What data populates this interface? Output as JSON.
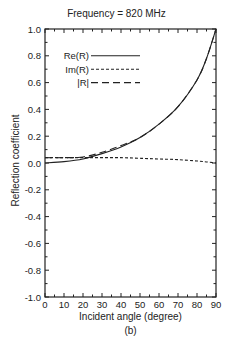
{
  "chart_data": {
    "type": "line",
    "title": "Frequency = 820 MHz",
    "xlabel": "Incident angle (degree)",
    "ylabel": "Reflection coefficient",
    "caption": "(b)",
    "xlim": [
      0,
      90
    ],
    "ylim": [
      -1.0,
      1.0
    ],
    "xticks": [
      0,
      10,
      20,
      30,
      40,
      50,
      60,
      70,
      80,
      90
    ],
    "yticks": [
      -1.0,
      -0.8,
      -0.6,
      -0.4,
      -0.2,
      0.0,
      0.2,
      0.4,
      0.6,
      0.8,
      1.0
    ],
    "ytick_labels": [
      "-1.0",
      "-0.8",
      "-0.6",
      "-0.4",
      "-0.2",
      "0.0",
      "0.2",
      "0.4",
      "0.6",
      "0.8",
      "1.0"
    ],
    "grid": false,
    "legend_position": "upper-left",
    "x": [
      0,
      10,
      20,
      30,
      40,
      50,
      60,
      70,
      80,
      85,
      90
    ],
    "series": [
      {
        "name": "Re(R)",
        "style": "solid",
        "values": [
          0.0,
          0.01,
          0.03,
          0.07,
          0.12,
          0.19,
          0.29,
          0.42,
          0.62,
          0.78,
          1.0
        ]
      },
      {
        "name": "Im(R)",
        "style": "short-dash",
        "values": [
          0.04,
          0.04,
          0.04,
          0.04,
          0.04,
          0.035,
          0.03,
          0.025,
          0.015,
          0.008,
          0.0
        ]
      },
      {
        "name": "|R|",
        "style": "long-dash",
        "values": [
          0.04,
          0.04,
          0.045,
          0.08,
          0.13,
          0.19,
          0.29,
          0.42,
          0.62,
          0.78,
          1.0
        ]
      }
    ]
  },
  "legend": [
    {
      "label": "Re(R)"
    },
    {
      "label": "Im(R)"
    },
    {
      "label": "|R|"
    }
  ]
}
